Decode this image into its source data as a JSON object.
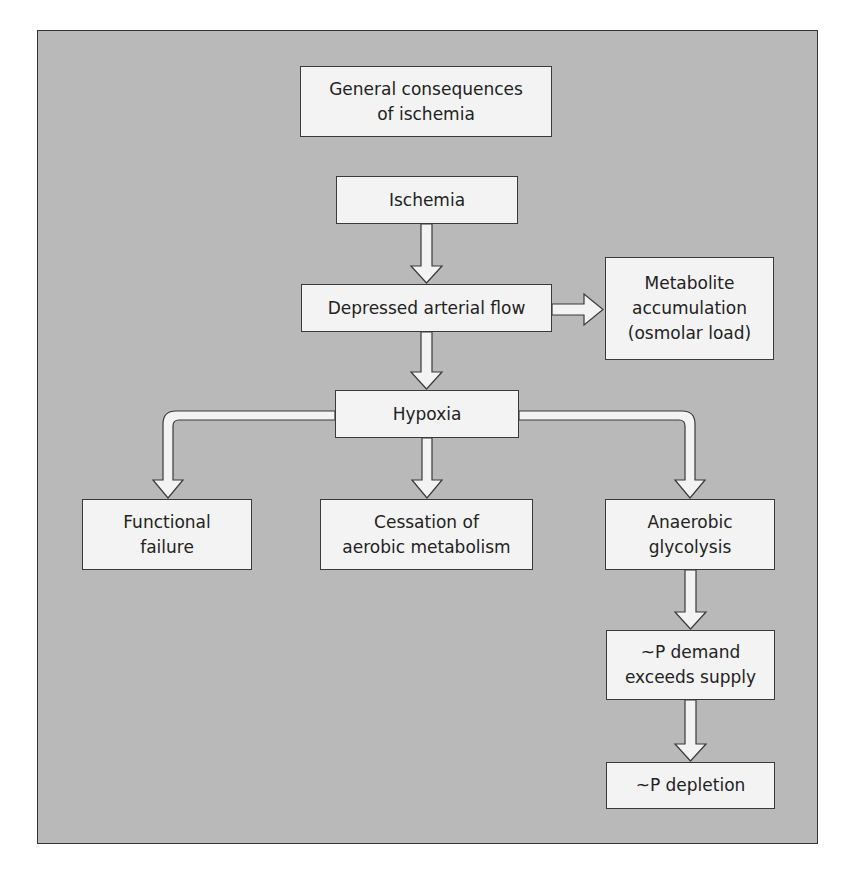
{
  "diagram": {
    "title": "General consequences\nof ischemia",
    "colors": {
      "background": "#b9b9b9",
      "box_fill": "#f3f3f3",
      "stroke": "#3a3a3a"
    },
    "nodes": {
      "ischemia": "Ischemia",
      "depressed_flow": "Depressed arterial flow",
      "metabolite": "Metabolite\naccumulation\n(osmolar load)",
      "hypoxia": "Hypoxia",
      "functional_failure": "Functional\nfailure",
      "cessation": "Cessation of\naerobic metabolism",
      "anaerobic": "Anaerobic\nglycolysis",
      "p_demand": "~P demand\nexceeds supply",
      "p_depletion": "~P depletion"
    },
    "edges": [
      {
        "from": "ischemia",
        "to": "depressed_flow"
      },
      {
        "from": "depressed_flow",
        "to": "metabolite"
      },
      {
        "from": "depressed_flow",
        "to": "hypoxia"
      },
      {
        "from": "hypoxia",
        "to": "functional_failure"
      },
      {
        "from": "hypoxia",
        "to": "cessation"
      },
      {
        "from": "hypoxia",
        "to": "anaerobic"
      },
      {
        "from": "anaerobic",
        "to": "p_demand"
      },
      {
        "from": "p_demand",
        "to": "p_depletion"
      }
    ]
  }
}
